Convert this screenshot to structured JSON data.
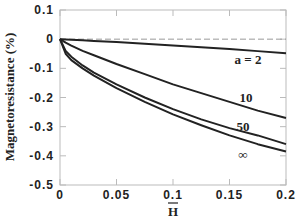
{
  "chart_data": {
    "type": "line",
    "title": "",
    "xlabel": "H̄",
    "ylabel": "Magnetoresistance (%)",
    "xlim": [
      0,
      0.2
    ],
    "ylim": [
      -0.5,
      0.1
    ],
    "x_ticks": [
      "0",
      "0.05",
      "0.1",
      "0.15",
      "0.2"
    ],
    "y_ticks": [
      "0.1",
      "0",
      "-0.1",
      "-0.2",
      "-0.3",
      "-0.4",
      "-0.5"
    ],
    "grid": false,
    "reference_line": {
      "y": 0,
      "style": "dashed"
    },
    "x": [
      0,
      0.005,
      0.01,
      0.02,
      0.03,
      0.05,
      0.075,
      0.1,
      0.125,
      0.15,
      0.175,
      0.2
    ],
    "series": [
      {
        "name": "a = 2",
        "label": "a = 2",
        "values": [
          0,
          -0.001,
          -0.002,
          -0.004,
          -0.006,
          -0.01,
          -0.016,
          -0.022,
          -0.028,
          -0.034,
          -0.041,
          -0.048
        ]
      },
      {
        "name": "10",
        "label": "10",
        "values": [
          0,
          -0.012,
          -0.022,
          -0.04,
          -0.055,
          -0.085,
          -0.12,
          -0.155,
          -0.185,
          -0.215,
          -0.245,
          -0.27
        ]
      },
      {
        "name": "50",
        "label": "50",
        "values": [
          0,
          -0.04,
          -0.06,
          -0.09,
          -0.115,
          -0.155,
          -0.2,
          -0.24,
          -0.275,
          -0.305,
          -0.33,
          -0.36
        ]
      },
      {
        "name": "∞",
        "label": "∞",
        "values": [
          0,
          -0.05,
          -0.072,
          -0.1,
          -0.125,
          -0.168,
          -0.215,
          -0.258,
          -0.295,
          -0.33,
          -0.36,
          -0.385
        ]
      }
    ]
  }
}
